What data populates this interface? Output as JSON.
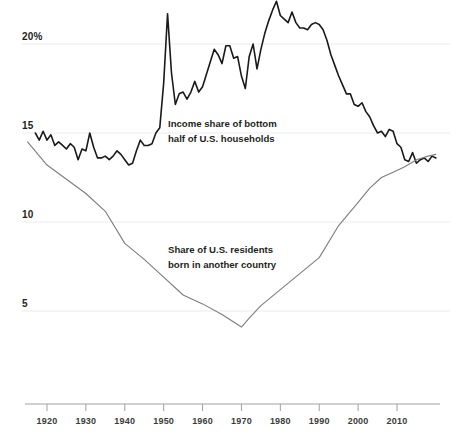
{
  "chart_data": {
    "type": "line",
    "title": "",
    "subtitle": "",
    "xlabel": "",
    "ylabel": "",
    "xlim": [
      1915,
      2016
    ],
    "ylim": [
      3.2,
      23.2
    ],
    "grid": true,
    "grid_axis": "y",
    "legend_position": "inline-annotation",
    "y_ticks": [
      {
        "value": 20,
        "label": "20%"
      },
      {
        "value": 15,
        "label": "15"
      },
      {
        "value": 10,
        "label": "10"
      },
      {
        "value": 5,
        "label": "5"
      }
    ],
    "x_ticks": [
      {
        "value": 1920,
        "label": "1920"
      },
      {
        "value": 1930,
        "label": "1930"
      },
      {
        "value": 1940,
        "label": "1940"
      },
      {
        "value": 1950,
        "label": "1950"
      },
      {
        "value": 1960,
        "label": "1960"
      },
      {
        "value": 1970,
        "label": "1970"
      },
      {
        "value": 1980,
        "label": "1980"
      },
      {
        "value": 1990,
        "label": "1990"
      },
      {
        "value": 2000,
        "label": "2000"
      },
      {
        "value": 2010,
        "label": "2010"
      }
    ],
    "series": [
      {
        "name": "Income share of bottom half of U.S. households",
        "color": "#1a1a1a",
        "width": 1.6,
        "annotation_lines": [
          "Income share of bottom",
          "half of U.S. households"
        ],
        "points": [
          [
            1917,
            15.0
          ],
          [
            1918,
            14.6
          ],
          [
            1919,
            15.1
          ],
          [
            1920,
            14.6
          ],
          [
            1921,
            14.9
          ],
          [
            1922,
            14.3
          ],
          [
            1923,
            14.5
          ],
          [
            1924,
            14.3
          ],
          [
            1925,
            14.1
          ],
          [
            1926,
            14.4
          ],
          [
            1927,
            14.2
          ],
          [
            1928,
            13.5
          ],
          [
            1929,
            14.1
          ],
          [
            1930,
            14.0
          ],
          [
            1931,
            15.0
          ],
          [
            1932,
            14.2
          ],
          [
            1933,
            13.6
          ],
          [
            1934,
            13.6
          ],
          [
            1935,
            13.7
          ],
          [
            1936,
            13.5
          ],
          [
            1937,
            13.7
          ],
          [
            1938,
            14.0
          ],
          [
            1939,
            13.8
          ],
          [
            1940,
            13.5
          ],
          [
            1941,
            13.2
          ],
          [
            1942,
            13.3
          ],
          [
            1943,
            14.0
          ],
          [
            1944,
            14.6
          ],
          [
            1945,
            14.3
          ],
          [
            1946,
            14.3
          ],
          [
            1947,
            14.4
          ],
          [
            1948,
            15.0
          ],
          [
            1949,
            15.3
          ],
          [
            1950,
            17.8
          ],
          [
            1951,
            21.7
          ],
          [
            1952,
            18.4
          ],
          [
            1953,
            16.6
          ],
          [
            1954,
            17.2
          ],
          [
            1955,
            17.3
          ],
          [
            1956,
            16.9
          ],
          [
            1957,
            17.3
          ],
          [
            1958,
            17.9
          ],
          [
            1959,
            17.3
          ],
          [
            1960,
            17.6
          ],
          [
            1961,
            18.3
          ],
          [
            1962,
            19.0
          ],
          [
            1963,
            19.7
          ],
          [
            1964,
            19.4
          ],
          [
            1965,
            18.9
          ],
          [
            1966,
            19.9
          ],
          [
            1967,
            19.9
          ],
          [
            1968,
            19.2
          ],
          [
            1969,
            19.3
          ],
          [
            1970,
            18.2
          ],
          [
            1971,
            17.5
          ],
          [
            1972,
            19.3
          ],
          [
            1973,
            20.0
          ],
          [
            1974,
            18.6
          ],
          [
            1975,
            19.7
          ],
          [
            1976,
            20.6
          ],
          [
            1977,
            21.3
          ],
          [
            1978,
            21.9
          ],
          [
            1979,
            22.4
          ],
          [
            1980,
            21.6
          ],
          [
            1981,
            21.4
          ],
          [
            1982,
            21.2
          ],
          [
            1983,
            21.8
          ],
          [
            1984,
            21.2
          ],
          [
            1985,
            20.9
          ],
          [
            1986,
            20.9
          ],
          [
            1987,
            20.8
          ],
          [
            1988,
            21.1
          ],
          [
            1989,
            21.2
          ],
          [
            1990,
            21.1
          ],
          [
            1991,
            20.8
          ],
          [
            1992,
            20.2
          ],
          [
            1993,
            19.4
          ],
          [
            1994,
            18.8
          ],
          [
            1995,
            18.2
          ],
          [
            1996,
            17.7
          ],
          [
            1997,
            17.2
          ],
          [
            1998,
            17.2
          ],
          [
            1999,
            16.6
          ],
          [
            2000,
            16.5
          ],
          [
            2001,
            16.7
          ],
          [
            2002,
            16.2
          ],
          [
            2003,
            15.9
          ],
          [
            2004,
            15.4
          ],
          [
            2005,
            15.0
          ],
          [
            2006,
            15.1
          ],
          [
            2007,
            14.8
          ],
          [
            2008,
            15.2
          ],
          [
            2009,
            15.1
          ],
          [
            2010,
            14.4
          ],
          [
            2011,
            14.2
          ],
          [
            2012,
            13.5
          ],
          [
            2013,
            13.4
          ],
          [
            2014,
            13.9
          ],
          [
            2015,
            13.3
          ],
          [
            2016,
            13.5
          ],
          [
            2017,
            13.6
          ],
          [
            2018,
            13.4
          ],
          [
            2019,
            13.7
          ],
          [
            2020,
            13.6
          ]
        ]
      },
      {
        "name": "Share of U.S. residents born in another country",
        "color": "#7d7d7d",
        "width": 1.1,
        "annotation_lines": [
          "Share of U.S. residents",
          "born in another country"
        ],
        "points": [
          [
            1915,
            14.5
          ],
          [
            1920,
            13.2
          ],
          [
            1925,
            12.4
          ],
          [
            1930,
            11.6
          ],
          [
            1935,
            10.6
          ],
          [
            1940,
            8.8
          ],
          [
            1945,
            7.9
          ],
          [
            1950,
            6.9
          ],
          [
            1955,
            5.9
          ],
          [
            1960,
            5.4
          ],
          [
            1965,
            4.8
          ],
          [
            1970,
            4.1
          ],
          [
            1972,
            4.6
          ],
          [
            1975,
            5.3
          ],
          [
            1980,
            6.2
          ],
          [
            1985,
            7.1
          ],
          [
            1990,
            8.0
          ],
          [
            1995,
            9.8
          ],
          [
            2000,
            11.1
          ],
          [
            2003,
            11.9
          ],
          [
            2006,
            12.5
          ],
          [
            2009,
            12.8
          ],
          [
            2012,
            13.1
          ],
          [
            2015,
            13.5
          ],
          [
            2018,
            13.7
          ],
          [
            2020,
            13.8
          ]
        ]
      }
    ]
  },
  "annotations": {
    "income_share": {
      "line1": "Income share of bottom",
      "line2": "half of U.S. households"
    },
    "foreign_born": {
      "line1": "Share of U.S. residents",
      "line2": "born in another country"
    }
  },
  "axis": {
    "y_labels": [
      "20%",
      "15",
      "10",
      "5"
    ],
    "x_labels": [
      "1920",
      "1930",
      "1940",
      "1950",
      "1960",
      "1970",
      "1980",
      "1990",
      "2000",
      "2010"
    ]
  },
  "colors": {
    "income_line": "#1a1a1a",
    "foreign_line": "#7d7d7d",
    "gridline": "#ececed",
    "axis_line": "#a0a0a0",
    "text": "#231f20"
  }
}
